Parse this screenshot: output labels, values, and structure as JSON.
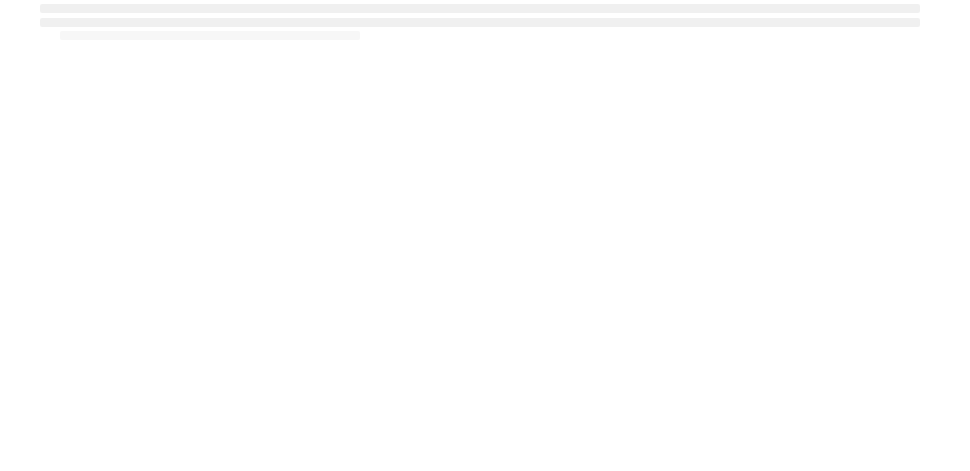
{
  "figure": {
    "panels_top": [
      {
        "id": "a",
        "label": "(a)",
        "kind": "image",
        "x": 30,
        "y": 37,
        "w": 196,
        "h": 149,
        "line_x": 69
      },
      {
        "id": "b",
        "label": "(b)",
        "kind": "image",
        "x": 268,
        "y": 37,
        "w": 197,
        "h": 149,
        "line_x": 69
      },
      {
        "id": "c",
        "label": "(c)",
        "kind": "image",
        "x": 508,
        "y": 36,
        "w": 194,
        "h": 150,
        "line_x": 70
      },
      {
        "id": "d",
        "label": "(d)",
        "kind": "image",
        "x": 744,
        "y": 36,
        "w": 197,
        "h": 150,
        "line_x": 70
      }
    ],
    "panels_bottom": [
      {
        "id": "e",
        "label": "(e)"
      },
      {
        "id": "f",
        "label": "(f)"
      },
      {
        "id": "g",
        "label": "(g)"
      },
      {
        "id": "h",
        "label": "(h)"
      }
    ]
  },
  "chart_data": [
    {
      "type": "line",
      "title": "(e)",
      "xlabel": "",
      "ylabel": "",
      "grid": false,
      "legend": null,
      "box": {
        "x": 56,
        "y": 266,
        "w": 151,
        "h": 121
      },
      "x": [
        0,
        0.02,
        0.05,
        0.1,
        0.13,
        0.15,
        0.18,
        0.21,
        0.22,
        0.23,
        0.25,
        0.28,
        0.32,
        0.36,
        0.4,
        0.41,
        0.42,
        0.45,
        0.5,
        0.55,
        0.6,
        0.65,
        0.7,
        0.73,
        0.75,
        0.8,
        0.85,
        0.9,
        0.95
      ],
      "values": [
        0.48,
        0.49,
        0.51,
        0.52,
        0.55,
        0.57,
        0.58,
        0.58,
        0.3,
        0.03,
        0.01,
        0.03,
        0.04,
        0.08,
        0.1,
        0.72,
        0.76,
        0.81,
        0.83,
        0.86,
        0.89,
        0.92,
        0.96,
        0.99,
        0.88,
        0.66,
        0.45,
        0.25,
        0.12
      ],
      "ylim": [
        0,
        1
      ],
      "xlim": [
        0,
        1
      ]
    },
    {
      "type": "line",
      "title": "(f)",
      "xlabel": "",
      "ylabel": "",
      "grid": false,
      "legend": null,
      "box": {
        "x": 293,
        "y": 266,
        "w": 155,
        "h": 121
      },
      "x": [
        0,
        0.05,
        0.1,
        0.13,
        0.15,
        0.18,
        0.2,
        0.21,
        0.22,
        0.24,
        0.28,
        0.32,
        0.36,
        0.39,
        0.4,
        0.42,
        0.45,
        0.5,
        0.55,
        0.6,
        0.65,
        0.7,
        0.73,
        0.75,
        0.8,
        0.85,
        0.9,
        0.95
      ],
      "values": [
        0.49,
        0.51,
        0.53,
        0.56,
        0.58,
        0.59,
        0.59,
        0.3,
        0.04,
        0.02,
        0.04,
        0.06,
        0.1,
        0.15,
        0.62,
        0.75,
        0.8,
        0.83,
        0.86,
        0.89,
        0.92,
        0.96,
        0.99,
        0.88,
        0.66,
        0.45,
        0.25,
        0.12
      ],
      "ylim": [
        0,
        1
      ],
      "xlim": [
        0,
        1
      ]
    },
    {
      "type": "line",
      "title": "(g)",
      "xlabel": "",
      "ylabel": "",
      "grid": false,
      "legend": null,
      "box": {
        "x": 535,
        "y": 265,
        "w": 149,
        "h": 121
      },
      "x": [
        0,
        0.05,
        0.1,
        0.13,
        0.15,
        0.18,
        0.2,
        0.21,
        0.22,
        0.25,
        0.28,
        0.32,
        0.36,
        0.4,
        0.41,
        0.45,
        0.5,
        0.55,
        0.6,
        0.65,
        0.7,
        0.73,
        0.75,
        0.8,
        0.85,
        0.9,
        0.95
      ],
      "values": [
        0.49,
        0.51,
        0.53,
        0.56,
        0.58,
        0.59,
        0.59,
        0.3,
        0.04,
        0.03,
        0.05,
        0.07,
        0.1,
        0.12,
        0.73,
        0.8,
        0.83,
        0.86,
        0.89,
        0.92,
        0.96,
        0.99,
        0.88,
        0.66,
        0.45,
        0.25,
        0.12
      ],
      "ylim": [
        0,
        1
      ],
      "xlim": [
        0,
        1
      ]
    },
    {
      "type": "line",
      "title": "(h)",
      "xlabel": "",
      "ylabel": "",
      "grid": false,
      "legend": null,
      "box": {
        "x": 769,
        "y": 264,
        "w": 153,
        "h": 120
      },
      "x": [
        0,
        0.21,
        0.215,
        0.39,
        0.395,
        0.42,
        0.5,
        0.6,
        0.7,
        0.73,
        0.8,
        0.87,
        0.93
      ],
      "values": [
        0.55,
        0.6,
        0.07,
        0.1,
        0.72,
        0.77,
        0.82,
        0.88,
        0.92,
        0.92,
        0.6,
        0.36,
        0.2
      ],
      "ylim": [
        0,
        1
      ],
      "xlim": [
        0,
        1
      ]
    }
  ]
}
